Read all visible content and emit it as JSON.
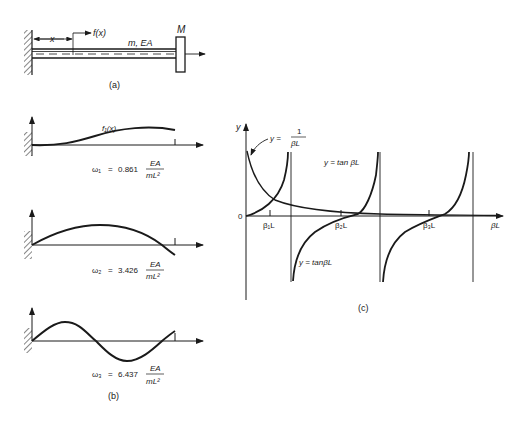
{
  "figure_a": {
    "label": "(a)",
    "x_label": "x",
    "force_label": "f(x)",
    "bar_label": "m, EA",
    "mass_label": "M"
  },
  "figure_b": {
    "label": "(b)",
    "mode1": {
      "curve_label": "f₁(x)",
      "omega": "ω₁",
      "value": "0.861",
      "num": "EA",
      "den": "mL²"
    },
    "mode2": {
      "omega": "ω₂",
      "value": "3.426",
      "num": "EA",
      "den": "mL²"
    },
    "mode3": {
      "omega": "ω₃",
      "value": "6.437",
      "num": "EA",
      "den": "mL²"
    },
    "eq": "="
  },
  "figure_c": {
    "label": "(c)",
    "y_axis": "y",
    "x_axis": "βL",
    "origin": "0",
    "hyperbola_lhs": "y =",
    "hyperbola_num": "1",
    "hyperbola_den": "βL",
    "tan_label_1": "y = tan βL",
    "tan_label_2": "y = tanβL",
    "roots": [
      "β₁L",
      "β₂L",
      "β₃L"
    ]
  }
}
